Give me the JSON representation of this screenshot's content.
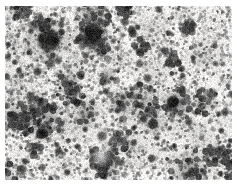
{
  "image": {
    "kind": "brightfield-micrograph",
    "modality": "grayscale transmitted-light micrograph",
    "alt_text": "Grayscale micrograph showing dense dark punctate staining on a pale mottled background",
    "background_color": "#f6f5f3",
    "stain_color": "#2b2b2b",
    "midtone_color": "#9a9a9a",
    "margin_color": "#ffffff",
    "frame": {
      "left": 5,
      "top": 6,
      "width": 227,
      "height": 174
    },
    "canvas": {
      "width": 227,
      "height": 174
    },
    "texture": {
      "seed": 20240517,
      "background_blotch_count": 150,
      "background_blotch_min_radius": 6,
      "background_blotch_max_radius": 26,
      "background_blotch_opacity": 0.1,
      "fine_speckle_count": 5200,
      "fine_speckle_min_radius": 0.5,
      "fine_speckle_max_radius": 1.7,
      "puncta_count": 1500,
      "puncta_min_radius": 1.4,
      "puncta_max_radius": 3.6,
      "large_puncta_count": 120,
      "large_puncta_min_radius": 3.2,
      "large_puncta_max_radius": 6.4,
      "cluster_count": 46,
      "cluster_min_radius": 7,
      "cluster_max_radius": 17,
      "filament_count": 60,
      "blur_radius_px": 0.45,
      "grain_opacity": 0.16
    },
    "density_gradient": {
      "description": "staining density highest at upper-left, decreasing toward lower-right",
      "top_left": 1.0,
      "top_right": 0.72,
      "bottom_left": 0.68,
      "bottom_right": 0.58
    },
    "notable_features": [
      {
        "name": "dark-cluster-upper-left",
        "x": 44,
        "y": 34,
        "radius": 13,
        "intensity": 0.92
      },
      {
        "name": "dark-cluster-upper-mid",
        "x": 88,
        "y": 26,
        "radius": 11,
        "intensity": 0.86
      },
      {
        "name": "dark-punctum-right-center",
        "x": 168,
        "y": 96,
        "radius": 7,
        "intensity": 0.95
      },
      {
        "name": "dark-punctum-lower-left",
        "x": 36,
        "y": 128,
        "radius": 6,
        "intensity": 0.9
      },
      {
        "name": "dark-punctum-lower-right",
        "x": 148,
        "y": 118,
        "radius": 6,
        "intensity": 0.88
      },
      {
        "name": "pale-void-lower-center",
        "x": 96,
        "y": 150,
        "radius": 12,
        "intensity": 0.2
      }
    ]
  }
}
